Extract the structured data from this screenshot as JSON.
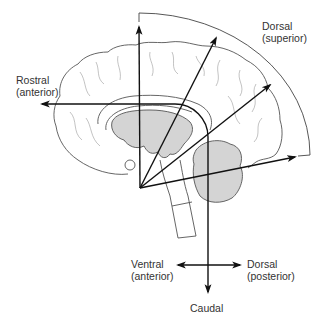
{
  "figure": {
    "labels": {
      "rostral": {
        "line1": "Rostral",
        "line2": "(anterior)"
      },
      "dorsal_superior": {
        "line1": "Dorsal",
        "line2": "(superior)"
      },
      "ventral_anterior": {
        "line1": "Ventral",
        "line2": "(anterior)"
      },
      "dorsal_posterior": {
        "line1": "Dorsal",
        "line2": "(posterior)"
      },
      "caudal": {
        "line1": "Caudal"
      }
    },
    "colors": {
      "axis_stroke": "#111111",
      "outline_stroke": "#555555",
      "fold_stroke": "#9a9a9a",
      "shaded_region": "#d4d4d4",
      "text": "#333333"
    }
  }
}
